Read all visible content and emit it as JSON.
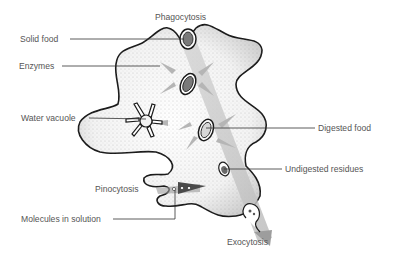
{
  "diagram": {
    "labels": {
      "phagocytosis": "Phagocytosis",
      "solid_food": "Solid food",
      "enzymes": "Enzymes",
      "water_vacuole": "Water vacuole",
      "digested_food": "Digested food",
      "undigested_residues": "Undigested residues",
      "pinocytosis": "Pinocytosis",
      "molecules_in_solution": "Molecules in solution",
      "exocytosis": "Exocytosis"
    },
    "colors": {
      "outline": "#1a1a1a",
      "cytoplasm": "#f2f2f2",
      "stipple": "#9a9a9a",
      "path_band": "#c8c8c8",
      "enzyme_arrow": "#b5b5b5",
      "vacuole_fill": "#7a7a7a",
      "pinocytosis_arrow": "#555555",
      "label_text": "#555555",
      "leader_line": "#333333"
    }
  }
}
